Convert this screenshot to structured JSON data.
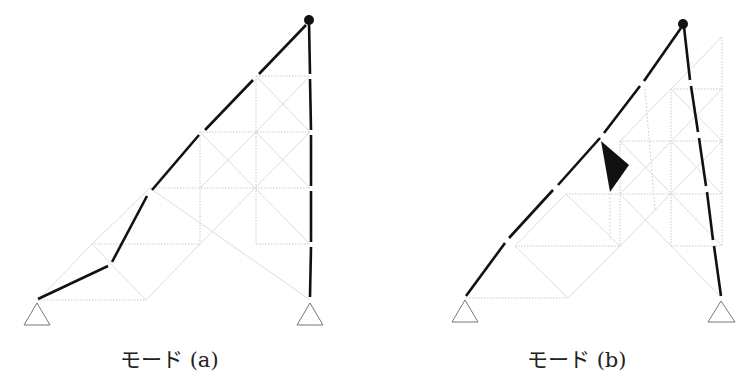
{
  "figures": [
    {
      "id": "a",
      "caption": "モード (a)",
      "description": "Collapse mode (a) of truss structure: bold lines show deformed members"
    },
    {
      "id": "b",
      "caption": "モード (b)",
      "description": "Collapse mode (b) of truss structure with rotating black triangular element"
    }
  ],
  "colors": {
    "member": "#111111",
    "grid": "#c8c8c8",
    "support": "#777777"
  }
}
